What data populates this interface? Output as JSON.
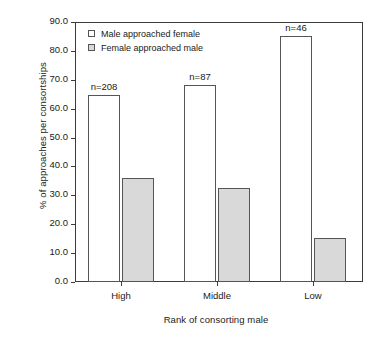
{
  "chart_data": {
    "type": "bar",
    "title": "",
    "xlabel": "Rank of consorting male",
    "ylabel": "% of approaches per consortships",
    "categories": [
      "High",
      "Middle",
      "Low"
    ],
    "ylim": [
      0.0,
      90.0
    ],
    "ytick_labels": [
      "0.0",
      "10.0",
      "20.0",
      "30.0",
      "40.0",
      "50.0",
      "60.0",
      "70.0",
      "80.0",
      "90.0"
    ],
    "ytick_values": [
      0.0,
      10.0,
      20.0,
      30.0,
      40.0,
      50.0,
      60.0,
      70.0,
      80.0,
      90.0
    ],
    "grid": false,
    "legend_position": "top-left inside axes",
    "series": [
      {
        "name": "Male approached female",
        "color": "#ffffff",
        "edge_color": "#555555",
        "values": [
          64.7,
          68.2,
          85.1
        ]
      },
      {
        "name": "Female approached male",
        "color": "#d9d9d9",
        "edge_color": "#555555",
        "values": [
          36.0,
          32.5,
          15.2
        ]
      }
    ],
    "annotations": [
      {
        "category": "High",
        "text": "n=208"
      },
      {
        "category": "Middle",
        "text": "n=87"
      },
      {
        "category": "Low",
        "text": "n=46"
      }
    ]
  },
  "legend": {
    "items": [
      {
        "label": "Male approached female",
        "swatch": "white"
      },
      {
        "label": "Female approached male",
        "swatch": "gray"
      }
    ]
  },
  "axes": {
    "x_title": "Rank of consorting male",
    "y_title": "% of approaches per consortships"
  }
}
